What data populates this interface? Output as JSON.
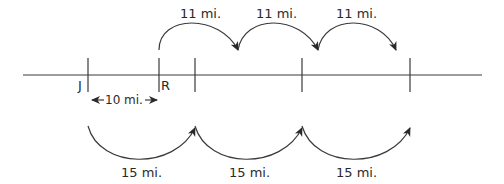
{
  "diagram": {
    "points": [
      {
        "label": "J"
      },
      {
        "label": "R"
      }
    ],
    "gap_label": "10 mi.",
    "top_jumps": [
      {
        "label": "11 mi."
      },
      {
        "label": "11 mi."
      },
      {
        "label": "11 mi."
      }
    ],
    "bottom_jumps": [
      {
        "label": "15 mi."
      },
      {
        "label": "15 mi."
      },
      {
        "label": "15 mi."
      }
    ],
    "colors": {
      "stroke": "#3a3a3a",
      "text": "#2a2a2a",
      "background": "#ffffff"
    }
  }
}
